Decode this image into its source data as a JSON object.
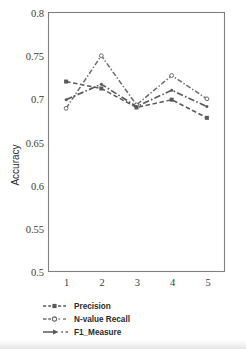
{
  "chart_data": {
    "type": "line",
    "title": "",
    "xlabel": "",
    "ylabel": "Accuracy",
    "categories": [
      "1",
      "2",
      "3",
      "4",
      "5"
    ],
    "ylim": [
      0.5,
      0.8
    ],
    "ytick_labels": [
      "0.8",
      "0.75",
      "0.7",
      "0.65",
      "0.6",
      "0.55",
      "0.5"
    ],
    "ytick_values": [
      0.8,
      0.75,
      0.7,
      0.65,
      0.6,
      0.55,
      0.5
    ],
    "grid": false,
    "legend_position": "bottom-left",
    "series": [
      {
        "name": "Precision",
        "values": [
          0.72,
          0.712,
          0.69,
          0.699,
          0.678
        ],
        "dash": "dashed",
        "marker": "square",
        "color": "#595959"
      },
      {
        "name": "N-value Recall",
        "values": [
          0.689,
          0.75,
          0.693,
          0.727,
          0.7
        ],
        "dash": "dash-dot",
        "marker": "circle-open",
        "color": "#6b6b6b"
      },
      {
        "name": "F1_Measure",
        "values": [
          0.699,
          0.717,
          0.691,
          0.71,
          0.691
        ],
        "dash": "dash-dot-long",
        "marker": "arrow",
        "color": "#5a5a5a"
      }
    ]
  },
  "axes": {
    "y_axis_title": "Accuracy"
  },
  "legend": {
    "items": [
      {
        "label": "Precision",
        "icon": "dashed-square-marker-icon"
      },
      {
        "label": "N-value Recall",
        "icon": "dashdot-open-circle-marker-icon"
      },
      {
        "label": "F1_Measure",
        "icon": "dashdot-arrow-marker-icon"
      }
    ]
  },
  "colors": {
    "frame": "#808080",
    "text": "#2b2b2b",
    "tick_text": "#3a3a3a",
    "series_precision": "#595959",
    "series_recall": "#6b6b6b",
    "series_f1": "#5a5a5a",
    "background": "#ffffff"
  }
}
